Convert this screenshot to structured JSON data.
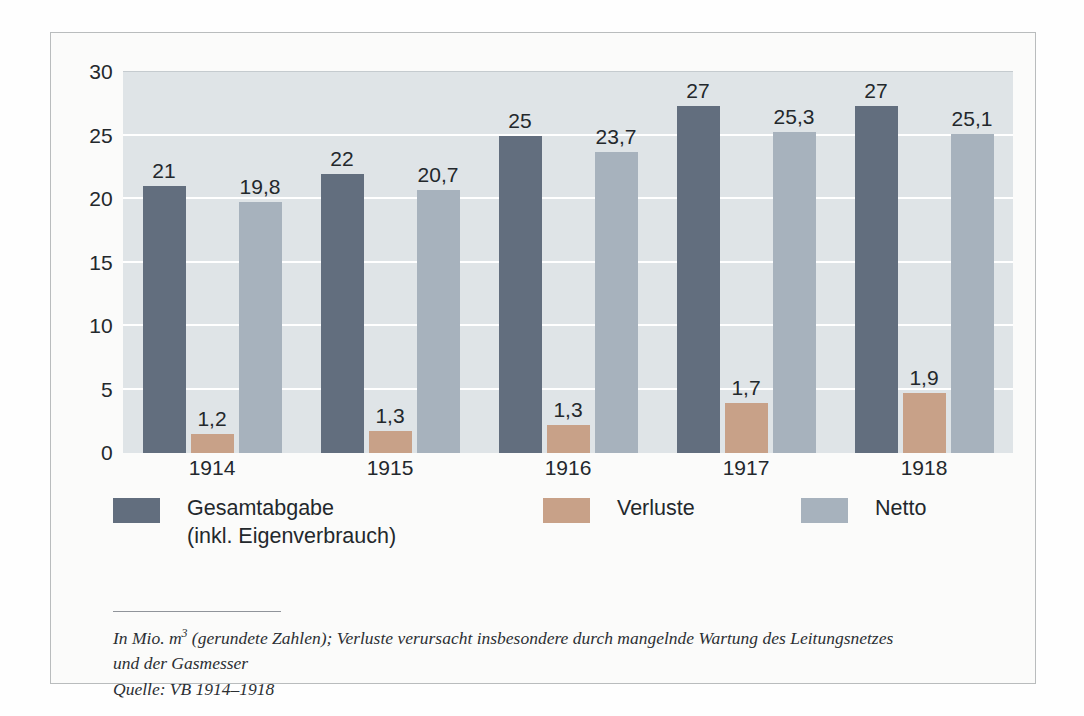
{
  "chart_data": {
    "type": "bar",
    "title": "",
    "subtitle": "",
    "xlabel": "",
    "ylabel": "",
    "categories": [
      "1914",
      "1915",
      "1916",
      "1917",
      "1918"
    ],
    "ylim": [
      0,
      30
    ],
    "yticks": [
      0,
      5,
      10,
      15,
      20,
      25,
      30
    ],
    "ytick_labels": [
      "0",
      "5",
      "10",
      "15",
      "20",
      "25",
      "30"
    ],
    "grid": true,
    "legend_position": "bottom",
    "series": [
      {
        "name": "Gesamtabgabe\n(inkl. Eigenverbrauch)",
        "legend_label": "Gesamtabgabe\n(inkl. Eigenverbrauch)",
        "color": "#626e7e",
        "values": [
          21,
          22,
          25,
          27,
          27
        ],
        "value_labels": [
          "21",
          "22",
          "25",
          "27",
          "27"
        ],
        "plotted_heights": [
          21,
          22,
          25,
          27.3,
          27.3
        ]
      },
      {
        "name": "Verluste",
        "legend_label": "Verluste",
        "color": "#c8a188",
        "values": [
          1.2,
          1.3,
          1.3,
          1.7,
          1.9
        ],
        "value_labels": [
          "1,2",
          "1,3",
          "1,3",
          "1,7",
          "1,9"
        ],
        "plotted_heights": [
          1.5,
          1.7,
          2.2,
          3.9,
          4.7
        ]
      },
      {
        "name": "Netto",
        "legend_label": "Netto",
        "color": "#a7b2bd",
        "values": [
          19.8,
          20.7,
          23.7,
          25.3,
          25.1
        ],
        "value_labels": [
          "19,8",
          "20,7",
          "23,7",
          "25,3",
          "25,1"
        ],
        "plotted_heights": [
          19.8,
          20.7,
          23.7,
          25.3,
          25.1
        ]
      }
    ],
    "annotations": []
  },
  "legend": {
    "items": [
      {
        "label": "Gesamtabgabe\n(inkl. Eigenverbrauch)",
        "color": "#626e7e"
      },
      {
        "label": "Verluste",
        "color": "#c8a188"
      },
      {
        "label": "Netto",
        "color": "#a7b2bd"
      }
    ]
  },
  "footnote": {
    "line1_prefix": "In Mio. m",
    "line1_sup": "3",
    "line1_rest": " (gerundete Zahlen); Verluste verursacht insbesondere durch mangelnde Wartung des Leitungsnetzes",
    "line2": "und der Gasmesser",
    "line3": "Quelle: VB 1914–1918"
  },
  "colors": {
    "page_background": "#ffffff",
    "card_background": "#fbfbfa",
    "card_border": "#b9bcbd",
    "plot_background": "#dfe4e7",
    "gridline": "#ffffff",
    "text": "#23282c",
    "rule": "#90949a"
  }
}
